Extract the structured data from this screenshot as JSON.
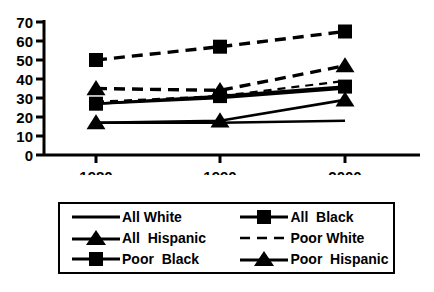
{
  "chart_data": {
    "type": "line",
    "title": "",
    "xlabel": "",
    "ylabel": "",
    "categories": [
      "1980",
      "1990",
      "2000"
    ],
    "x": [
      1980,
      1990,
      2000
    ],
    "ylim": [
      0,
      70
    ],
    "xlim": [
      1975,
      2005
    ],
    "yticks": [
      0,
      10,
      20,
      30,
      40,
      50,
      60,
      70
    ],
    "ytick_labels": [
      "0",
      "10",
      "20",
      "30",
      "40",
      "50",
      "60",
      "70"
    ],
    "xtick_labels": [
      "1980",
      "1990",
      "2000"
    ],
    "grid": false,
    "legend_position": "below-plot-boxed",
    "series": [
      {
        "name": "All White",
        "values": [
          27,
          30,
          35
        ],
        "line_style": "solid",
        "marker": "none",
        "color": "#000000"
      },
      {
        "name": "All Black",
        "values": [
          27,
          31,
          36
        ],
        "line_style": "solid",
        "marker": "square",
        "color": "#000000"
      },
      {
        "name": "All Hispanic",
        "values": [
          17,
          17,
          18
        ],
        "line_style": "solid",
        "marker": "none",
        "color": "#000000"
      },
      {
        "name": "Poor White",
        "values": [
          28,
          31,
          39
        ],
        "line_style": "dashed-thin",
        "marker": "none",
        "color": "#000000"
      },
      {
        "name": "Poor Black",
        "values": [
          50,
          57,
          65
        ],
        "line_style": "dashed",
        "marker": "square",
        "color": "#000000"
      },
      {
        "name": "Poor Hispanic",
        "values": [
          35,
          34,
          47
        ],
        "line_style": "dashed",
        "marker": "triangle",
        "color": "#000000"
      },
      {
        "name": "Poor Hispanic Lower",
        "values": [
          17,
          18,
          29
        ],
        "line_style": "solid",
        "marker": "triangle",
        "color": "#000000"
      }
    ]
  },
  "legend": {
    "entries": [
      {
        "label": "All White",
        "symbol": "line-plain",
        "row": 0,
        "col": 0
      },
      {
        "label": "All  Black",
        "symbol": "line-square",
        "row": 0,
        "col": 1
      },
      {
        "label": "All  Hispanic",
        "symbol": "line-triangle",
        "row": 1,
        "col": 0
      },
      {
        "label": "Poor White",
        "symbol": "line-dashed",
        "row": 1,
        "col": 1
      },
      {
        "label": "Poor  Black",
        "symbol": "line-square",
        "row": 2,
        "col": 0
      },
      {
        "label": "Poor  Hispanic",
        "symbol": "line-triangle",
        "row": 2,
        "col": 1
      }
    ]
  },
  "caption": {
    "text": ""
  }
}
